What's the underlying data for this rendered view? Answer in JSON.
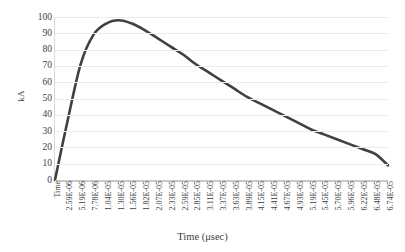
{
  "chart_data": {
    "type": "line",
    "title": "",
    "xlabel": "Time (μsec)",
    "ylabel": "kA",
    "ylim": [
      0,
      100
    ],
    "y_ticks": [
      100,
      90,
      80,
      70,
      60,
      50,
      40,
      30,
      20,
      10,
      0
    ],
    "grid": true,
    "legend": "none",
    "first_tick_label": "Time",
    "categories": [
      "Time",
      "2.59E-06",
      "5.19E-06",
      "7.78E-06",
      "1.04E-05",
      "1.30E-05",
      "1.56E-05",
      "1.82E-05",
      "2.07E-05",
      "2.33E-05",
      "2.59E-05",
      "2.85E-05",
      "3.11E-05",
      "3.37E-05",
      "3.63E-05",
      "3.89E-05",
      "4.15E-05",
      "4.41E-05",
      "4.67E-05",
      "4.93E-05",
      "5.19E-05",
      "5.45E-05",
      "5.70E-05",
      "5.96E-05",
      "6.22E-05",
      "6.48E-05",
      "6.74E-05"
    ],
    "series": [
      {
        "name": "Lightning current",
        "color": "#404040",
        "values": [
          0,
          37,
          71,
          89,
          96,
          98,
          96,
          92,
          87,
          82,
          77,
          71,
          66,
          61,
          56,
          51,
          47,
          43,
          39,
          35,
          31,
          28,
          25,
          22,
          19,
          16,
          9
        ]
      }
    ],
    "annotations": {
      "peak_value": 98,
      "peak_at": "1.30E-05",
      "end_value": 9
    },
    "colors": {
      "line": "#404040",
      "grid": "#ececed",
      "axis": "#c9c9c9",
      "text": "#3d3d3d",
      "background": "#ffffff"
    }
  }
}
